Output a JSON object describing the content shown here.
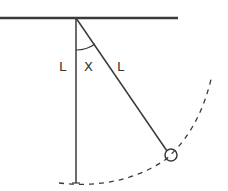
{
  "diagram": {
    "type": "pendulum",
    "labels": {
      "vertical_length": "L",
      "pendulum_length": "L",
      "angle": "X"
    },
    "colors": {
      "stroke": "#3a3a3a",
      "background": "#ffffff"
    }
  }
}
